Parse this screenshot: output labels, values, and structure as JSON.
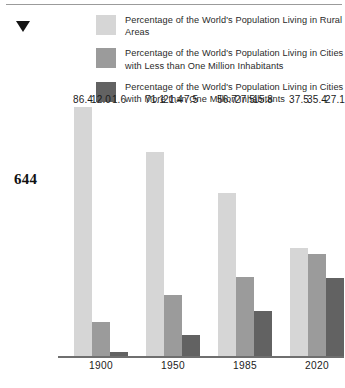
{
  "page": {
    "folio": "644",
    "marker_icon": "down-triangle-icon"
  },
  "legend": {
    "items": [
      {
        "label": "Percentage of the World's Population Living in Rural Areas",
        "color": "#d6d6d6",
        "swatch_name": "legend-swatch-rural"
      },
      {
        "label": "Percentage of the World's Population Living in Cities with Less than One Million Inhabitants",
        "color": "#9b9b9b",
        "swatch_name": "legend-swatch-small-cities"
      },
      {
        "label": "Percentage of the World's Population Living in Cities with More than One Million Inhabitants",
        "color": "#626262",
        "swatch_name": "legend-swatch-large-cities"
      }
    ]
  },
  "chart_data": {
    "type": "bar",
    "title": "",
    "subtitle": "",
    "xlabel": "",
    "ylabel": "",
    "ylim": [
      0,
      86.4
    ],
    "grid": false,
    "legend_position": "top-right",
    "categories": [
      "1900",
      "1950",
      "1985",
      "2020"
    ],
    "series": [
      {
        "name": "Percentage of the World's Population Living in Rural Areas",
        "color": "#d6d6d6",
        "values": [
          86.4,
          71.1,
          56.7,
          37.5
        ],
        "labels": [
          "86.4",
          "71.1",
          "56.7",
          "37.5"
        ]
      },
      {
        "name": "Percentage of the World's Population Living in Cities with Less than One Million Inhabitants",
        "color": "#9b9b9b",
        "values": [
          12.0,
          21.4,
          27.5,
          35.4
        ],
        "labels": [
          "12.0",
          "21.4",
          "27.5",
          "35.4"
        ]
      },
      {
        "name": "Percentage of the World's Population Living in Cities with More than One Million Inhabitants",
        "color": "#626262",
        "values": [
          1.6,
          7.5,
          15.8,
          27.1
        ],
        "labels": [
          "1.6",
          "7.5",
          "15.8",
          "27.1"
        ]
      }
    ]
  }
}
